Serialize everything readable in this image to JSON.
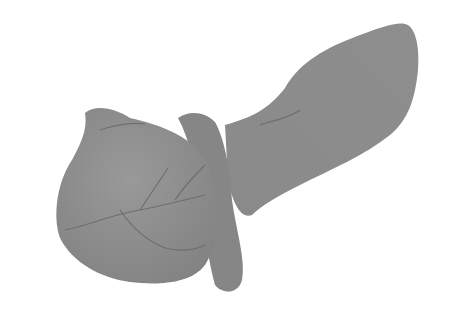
{
  "image": {
    "subject": "grayscale anatomical illustration of an organ",
    "background_color": "#ffffff",
    "fill_color": "#8f8f8f",
    "shade_color": "#7f7f7f",
    "vein_color": "#6e6e6e"
  }
}
